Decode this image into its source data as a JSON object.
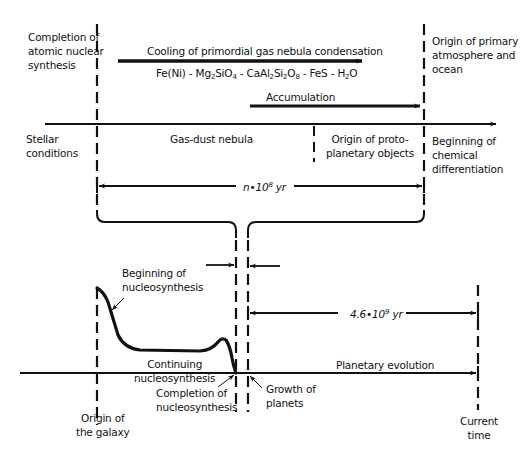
{
  "diagram": {
    "type": "timeline-flow",
    "colors": {
      "line": "#111111",
      "background": "#ffffff"
    },
    "upper_timeline": {
      "labels": {
        "completion_atomic": "Completion of\natomic nuclear\nsynthesis",
        "origin_atmosphere": "Origin of primary\natmosphere and\nocean",
        "cooling": "Cooling of primordial gas nebula condensation",
        "formula": {
          "p1": "Fe(Ni) - Mg",
          "s1": "2",
          "p2": "SiO",
          "s2": "4",
          "p3": " - CaAl",
          "s3": "2",
          "p4": "Si",
          "s4": "2",
          "p5": "O",
          "s5": "8",
          "p6": " - FeS - H",
          "s6": "2",
          "p7": "O"
        },
        "accumulation": "Accumulation",
        "stellar": "Stellar\nconditions",
        "gas_dust": "Gas-dust nebula",
        "proto": "Origin of proto-\nplanetary objects",
        "chem_diff": "Beginning of\nchemical\ndifferentiation",
        "duration": {
          "base": "n•10",
          "exp": "8",
          "unit": " yr"
        }
      }
    },
    "lower_timeline": {
      "labels": {
        "begin_nucleo": "Beginning of\nnucleosynthesis",
        "continuing": "Continuing\nnucleosynthesis",
        "completion_nucleo": "Completion of\nnucleosynthesis",
        "growth": "Growth of\nplanets",
        "planetary_evolution": "Planetary evolution",
        "origin_galaxy": "Origin of\nthe galaxy",
        "current_time": "Current\ntime",
        "duration": {
          "base": "4.6•10",
          "exp": "9",
          "unit": " yr"
        }
      }
    }
  }
}
